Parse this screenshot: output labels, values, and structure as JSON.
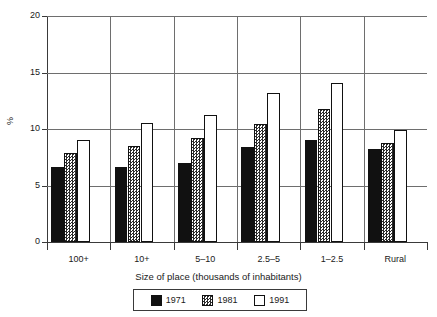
{
  "chart_data": {
    "type": "bar",
    "title": "",
    "subtitle": "",
    "xlabel": "Size of place (thousands of inhabitants)",
    "ylabel": "%",
    "categories": [
      "100+",
      "10+",
      "5–10",
      "2.5–5",
      "1–2.5",
      "Rural"
    ],
    "series": [
      {
        "name": "1971",
        "values": [
          6.6,
          6.6,
          7.0,
          8.4,
          9.0,
          8.2
        ]
      },
      {
        "name": "1981",
        "values": [
          7.9,
          8.5,
          9.2,
          10.4,
          11.8,
          8.8
        ]
      },
      {
        "name": "1991",
        "values": [
          9.0,
          10.5,
          11.2,
          13.2,
          14.1,
          9.9
        ]
      }
    ],
    "ylim": [
      0,
      20
    ],
    "yticks": [
      0,
      5,
      10,
      15,
      20
    ],
    "ytick_labels": [
      "0",
      "5",
      "10",
      "15",
      "20"
    ],
    "grid": "horizontal-and-vertical",
    "legend_position": "bottom-center",
    "colors": {
      "series_1971": "#111111",
      "series_1981": "#2b2b2b",
      "series_1991": "#ffffff",
      "axis": "#3a3a3a",
      "gridline": "#6e6e6e",
      "background": "#ffffff"
    }
  },
  "legend": {
    "entries": [
      {
        "label": "1971",
        "swatch": "solid-black-swatch"
      },
      {
        "label": "1981",
        "swatch": "checkered-gray-swatch"
      },
      {
        "label": "1991",
        "swatch": "white-outline-swatch"
      }
    ]
  }
}
